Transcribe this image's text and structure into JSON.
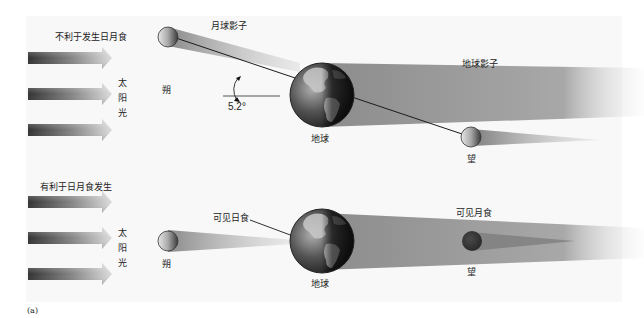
{
  "top_panel": {
    "title": "不利于发生日月食",
    "sunlight_label": [
      "太",
      "阳",
      "光"
    ],
    "moon_shadow_label": "月球影子",
    "earth_shadow_label": "地球影子",
    "new_moon_label": "朔",
    "full_moon_label": "望",
    "earth_label": "地球",
    "angle_label": "5.2°"
  },
  "bottom_panel": {
    "title": "有利于日月食发生",
    "sunlight_label": [
      "太",
      "阳",
      "光"
    ],
    "solar_eclipse_label": "可见日食",
    "lunar_eclipse_label": "可见月食",
    "new_moon_label": "朔",
    "full_moon_label": "望",
    "earth_label": "地球"
  },
  "figure_label": "(a)",
  "colors": {
    "background": "#f8f8f8",
    "shadow": "#9a9a9a",
    "arrow_dark": "#3a3a3a",
    "arrow_light": "#d8d8d8",
    "eclipsed_moon": "#3a3a3a"
  }
}
